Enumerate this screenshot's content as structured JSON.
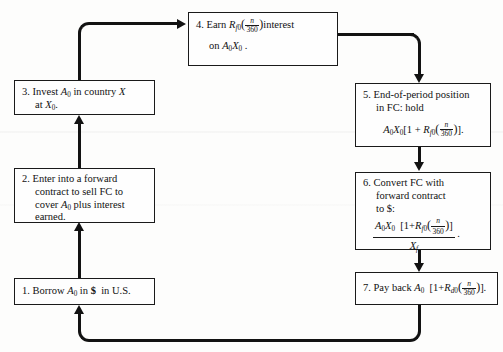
{
  "diagram": {
    "boxes": [
      {
        "id": "box1",
        "number": "1.",
        "lines": [
          "Borrow A0 in $ in U.S."
        ],
        "formula": ""
      },
      {
        "id": "box2",
        "number": "2.",
        "lines": [
          "Enter into a forward",
          "contract to sell FC to",
          "cover A0 plus interest",
          "earned."
        ],
        "formula": ""
      },
      {
        "id": "box3",
        "number": "3.",
        "lines": [
          "Invest A0 in country X",
          "at X0."
        ],
        "formula": ""
      },
      {
        "id": "box4",
        "number": "4.",
        "lines": [
          "Earn Rf0(n/360) interest",
          "on A0X0."
        ],
        "formula": ""
      },
      {
        "id": "box5",
        "number": "5.",
        "lines": [
          "End-of-period position",
          "in FC: hold"
        ],
        "formula": "A0X0[1 + Rf0(n/360)]."
      },
      {
        "id": "box6",
        "number": "6.",
        "lines": [
          "Convert FC with",
          "forward contract",
          "to $:"
        ],
        "formula": "A0X0 [1+Rf0(n/360)] / Xf ."
      },
      {
        "id": "box7",
        "number": "7.",
        "lines": [
          "Pay back A0 [1+Rd0(n/360)]."
        ],
        "formula": ""
      }
    ],
    "symbols": {
      "A": "A",
      "X": "X",
      "R": "R",
      "sub0": "0",
      "subf": "f",
      "subd": "d",
      "subf0": "f0",
      "subd0": "d0",
      "n": "n",
      "denominator": "360",
      "currency": "$",
      "fc": "FC",
      "country": "U.S."
    },
    "labels": {
      "interest_word": "interest",
      "earn_word": "Earn",
      "borrow_word": "Borrow",
      "invest_word": "Invest",
      "in_word": "in",
      "at_word": "at",
      "country_word": "country",
      "pay_back": "Pay back",
      "enter_into": "Enter into a forward",
      "contract_sell": "contract to sell FC to",
      "cover_plus": "plus interest",
      "cover_word": "cover",
      "earned_word": "earned.",
      "end_of_period": "End-of-period position",
      "in_fc_hold": "in FC: hold",
      "convert_fc": "Convert FC with",
      "forward_contract": "forward contract",
      "to_dollar": "to $:",
      "on_word": "on",
      "period": ".",
      "in_us": "in U.S."
    },
    "connectors": [
      {
        "name": "box1-to-box2",
        "direction": "up"
      },
      {
        "name": "box2-to-box3",
        "direction": "up"
      },
      {
        "name": "box3-to-box4",
        "direction": "up-then-right"
      },
      {
        "name": "box4-to-box5",
        "direction": "right-then-down"
      },
      {
        "name": "box5-to-box6",
        "direction": "down"
      },
      {
        "name": "box6-to-box7",
        "direction": "down"
      },
      {
        "name": "box7-to-box1",
        "direction": "down-left-then-up"
      }
    ],
    "colors": {
      "line": "#121212",
      "border": "#1a1a1a",
      "background": "#fdfdfc",
      "text": "#111111"
    }
  }
}
